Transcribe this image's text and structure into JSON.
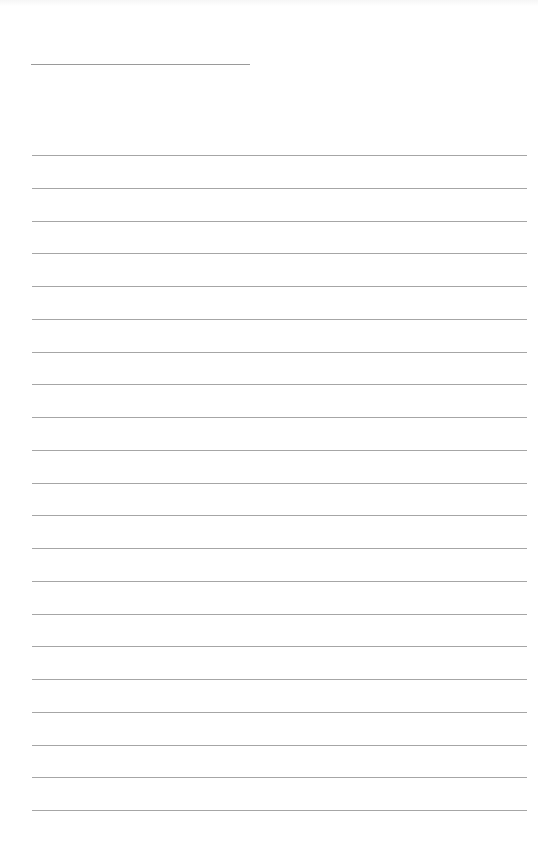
{
  "page": {
    "type": "ruled-sheet",
    "header_line": {
      "x": 31,
      "y": 64,
      "width": 219
    },
    "rules": {
      "count": 21,
      "first_y": 155,
      "spacing": 32.75,
      "left": 32,
      "right_margin": 11
    },
    "colors": {
      "background": "#fdfdfd",
      "rule": "#a6a6a6"
    }
  }
}
